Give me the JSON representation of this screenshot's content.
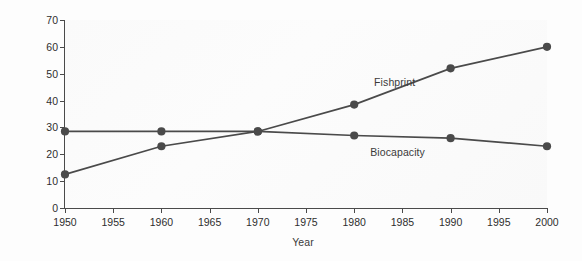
{
  "chart_data": {
    "type": "line",
    "title": "",
    "xlabel": "Year",
    "ylabel": "Global hectares (millions)",
    "xlim": [
      1950,
      2000
    ],
    "ylim": [
      0,
      70
    ],
    "grid": false,
    "legend_position": "inline-annotations",
    "x": [
      1950,
      1960,
      1970,
      1980,
      1990,
      2000
    ],
    "xticks": [
      "1950",
      "1955",
      "1960",
      "1965",
      "1970",
      "1975",
      "1980",
      "1985",
      "1990",
      "1995",
      "2000"
    ],
    "xtick_values": [
      1950,
      1955,
      1960,
      1965,
      1970,
      1975,
      1980,
      1985,
      1990,
      1995,
      2000
    ],
    "yticks": [
      "0",
      "10",
      "20",
      "30",
      "40",
      "50",
      "60",
      "70"
    ],
    "ytick_values": [
      0,
      10,
      20,
      30,
      40,
      50,
      60,
      70
    ],
    "series": [
      {
        "name": "Fishprint",
        "values": [
          12.5,
          23,
          28.5,
          38.5,
          52,
          60
        ],
        "color": "#4a4a4a",
        "marker": "circle",
        "label_x": 1984.2,
        "label_y": 46.5
      },
      {
        "name": "Biocapacity",
        "values": [
          28.5,
          28.5,
          28.5,
          27,
          26,
          23
        ],
        "color": "#4a4a4a",
        "marker": "circle",
        "label_x": 1984.5,
        "label_y": 20.5
      }
    ]
  },
  "style": {
    "line_color": "#4a4a4a",
    "marker_color": "#4a4a4a",
    "axis_color": "#4a4a4a",
    "text_color": "#2e2e2e",
    "plot_background": "#fbfbfb",
    "page_background": "#fdfdfd"
  }
}
